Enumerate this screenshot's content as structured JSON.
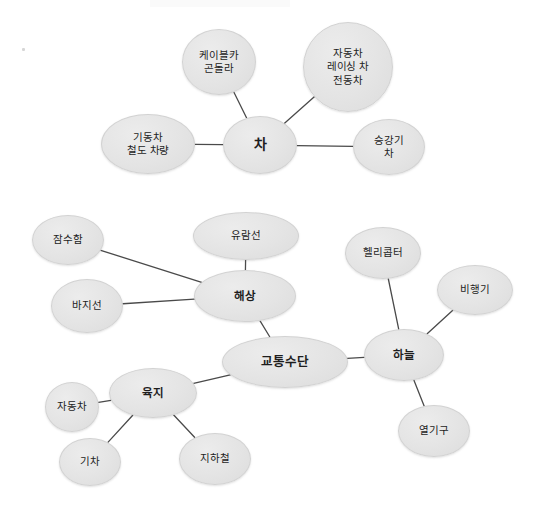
{
  "document": {
    "kind": "mind-map-diagram",
    "title": "교통수단 마인드맵",
    "background_color": "#ffffff",
    "node_fill_color": "#e4e4e4",
    "node_border_color": "#d2d2d2",
    "edge_color": "#4a4a4a",
    "text_color": "#1d1d1d",
    "width": 536,
    "height": 507
  },
  "clusters": [
    {
      "id": "car-cluster",
      "root_id": "cha",
      "name": "차 클러스터"
    },
    {
      "id": "transport-cluster",
      "root_id": "gyotongsudan",
      "name": "교통수단 클러스터"
    }
  ],
  "nodes": [
    {
      "id": "cable-car",
      "label": "케이블카\n곤돌라",
      "role": "leaf",
      "cluster": "car-cluster",
      "cx": 219,
      "cy": 62,
      "rx": 37,
      "ry": 33
    },
    {
      "id": "jadongcha-top",
      "label": "자동차\n레이싱 차\n전동차",
      "role": "leaf",
      "cluster": "car-cluster",
      "cx": 348,
      "cy": 67,
      "rx": 45,
      "ry": 45
    },
    {
      "id": "gidongcha",
      "label": "기동차\n철도 차량",
      "role": "leaf",
      "cluster": "car-cluster",
      "cx": 148,
      "cy": 144,
      "rx": 47,
      "ry": 30
    },
    {
      "id": "cha",
      "label": "차",
      "role": "center-car",
      "cluster": "car-cluster",
      "cx": 260,
      "cy": 145,
      "rx": 37,
      "ry": 29
    },
    {
      "id": "seunggangi",
      "label": "승강기\n차",
      "role": "leaf",
      "cluster": "car-cluster",
      "cx": 389,
      "cy": 147,
      "rx": 36,
      "ry": 28
    },
    {
      "id": "jamsuham",
      "label": "잠수함",
      "role": "leaf",
      "cluster": "transport-cluster",
      "cx": 68,
      "cy": 240,
      "rx": 36,
      "ry": 25
    },
    {
      "id": "yuramseon",
      "label": "유람선",
      "role": "leaf",
      "cluster": "transport-cluster",
      "cx": 246,
      "cy": 236,
      "rx": 53,
      "ry": 24
    },
    {
      "id": "hellikopteo",
      "label": "헬리콥터",
      "role": "leaf",
      "cluster": "transport-cluster",
      "cx": 383,
      "cy": 253,
      "rx": 38,
      "ry": 26
    },
    {
      "id": "bijeonggi",
      "label": "비행기",
      "role": "leaf",
      "cluster": "transport-cluster",
      "cx": 475,
      "cy": 290,
      "rx": 38,
      "ry": 25
    },
    {
      "id": "haesang",
      "label": "해상",
      "role": "hub",
      "cluster": "transport-cluster",
      "cx": 245,
      "cy": 296,
      "rx": 51,
      "ry": 26
    },
    {
      "id": "bajiseon",
      "label": "바지선",
      "role": "leaf",
      "cluster": "transport-cluster",
      "cx": 87,
      "cy": 306,
      "rx": 36,
      "ry": 27
    },
    {
      "id": "haneul",
      "label": "하늘",
      "role": "hub",
      "cluster": "transport-cluster",
      "cx": 404,
      "cy": 355,
      "rx": 40,
      "ry": 26
    },
    {
      "id": "gyotongsudan",
      "label": "교통수단",
      "role": "root",
      "cluster": "transport-cluster",
      "cx": 285,
      "cy": 362,
      "rx": 63,
      "ry": 26
    },
    {
      "id": "yukji",
      "label": "육지",
      "role": "hub",
      "cluster": "transport-cluster",
      "cx": 153,
      "cy": 393,
      "rx": 44,
      "ry": 25
    },
    {
      "id": "jadongcha-bottom",
      "label": "자동차",
      "role": "leaf",
      "cluster": "transport-cluster",
      "cx": 72,
      "cy": 407,
      "rx": 27,
      "ry": 25
    },
    {
      "id": "yeolgigu",
      "label": "열기구",
      "role": "leaf",
      "cluster": "transport-cluster",
      "cx": 434,
      "cy": 431,
      "rx": 36,
      "ry": 26
    },
    {
      "id": "gicha",
      "label": "기차",
      "role": "leaf",
      "cluster": "transport-cluster",
      "cx": 90,
      "cy": 462,
      "rx": 31,
      "ry": 24
    },
    {
      "id": "jihacheol",
      "label": "지하철",
      "role": "leaf",
      "cluster": "transport-cluster",
      "cx": 215,
      "cy": 459,
      "rx": 36,
      "ry": 26
    }
  ],
  "edges": [
    {
      "from": "cable-car",
      "to": "cha"
    },
    {
      "from": "jadongcha-top",
      "to": "cha"
    },
    {
      "from": "gidongcha",
      "to": "cha"
    },
    {
      "from": "seunggangi",
      "to": "cha"
    },
    {
      "from": "jamsuham",
      "to": "haesang"
    },
    {
      "from": "bajiseon",
      "to": "haesang"
    },
    {
      "from": "yuramseon",
      "to": "haesang"
    },
    {
      "from": "haesang",
      "to": "gyotongsudan"
    },
    {
      "from": "gyotongsudan",
      "to": "haneul"
    },
    {
      "from": "gyotongsudan",
      "to": "yukji"
    },
    {
      "from": "hellikopteo",
      "to": "haneul"
    },
    {
      "from": "bijeonggi",
      "to": "haneul"
    },
    {
      "from": "yeolgigu",
      "to": "haneul"
    },
    {
      "from": "jadongcha-bottom",
      "to": "yukji"
    },
    {
      "from": "gicha",
      "to": "yukji"
    },
    {
      "from": "jihacheol",
      "to": "yukji"
    }
  ],
  "artifacts": [
    {
      "id": "speck-top-left",
      "x": 22,
      "y": 48
    }
  ]
}
